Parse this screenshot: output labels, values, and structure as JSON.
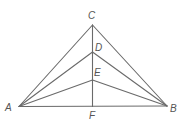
{
  "diagram": {
    "type": "geometry-figure",
    "colors": {
      "line": "#6a6a6a",
      "label": "#555555",
      "background": "#ffffff"
    },
    "points": {
      "A": {
        "x": 19,
        "y": 106.5,
        "label": "A",
        "lx": 5,
        "ly": 111
      },
      "B": {
        "x": 167,
        "y": 106,
        "label": "B",
        "lx": 170,
        "ly": 112
      },
      "C": {
        "x": 92.5,
        "y": 25,
        "label": "C",
        "lx": 88,
        "ly": 19
      },
      "D": {
        "x": 92.5,
        "y": 52,
        "label": "D",
        "lx": 95,
        "ly": 51
      },
      "E": {
        "x": 92.5,
        "y": 80,
        "label": "E",
        "lx": 94,
        "ly": 76
      },
      "F": {
        "x": 92.5,
        "y": 106.5,
        "label": "F",
        "lx": 89,
        "ly": 119
      }
    },
    "segments": [
      [
        "A",
        "B"
      ],
      [
        "A",
        "C"
      ],
      [
        "C",
        "B"
      ],
      [
        "C",
        "F"
      ],
      [
        "A",
        "D"
      ],
      [
        "D",
        "B"
      ],
      [
        "A",
        "E"
      ],
      [
        "E",
        "B"
      ]
    ]
  }
}
